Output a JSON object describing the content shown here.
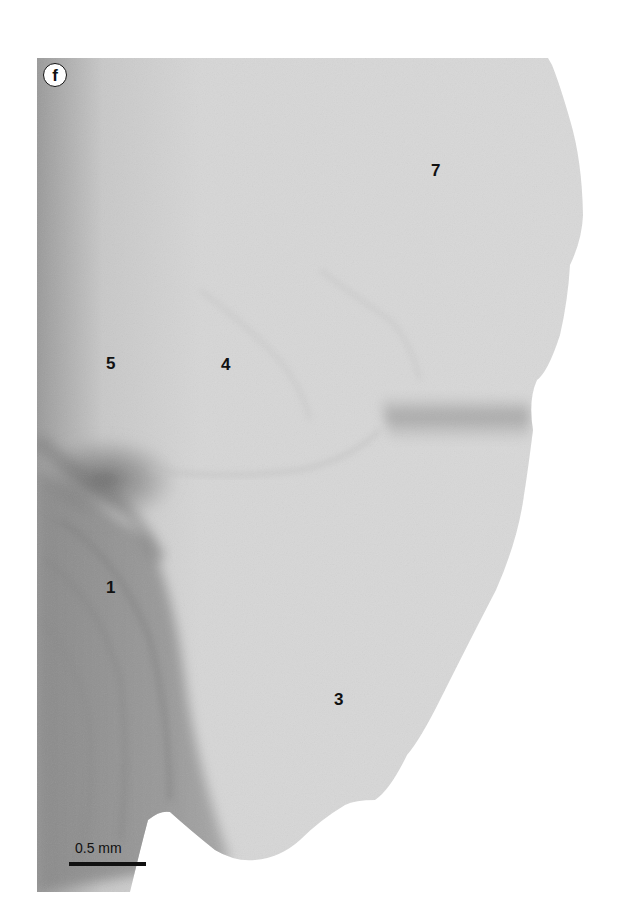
{
  "figure": {
    "panel_label": "f",
    "scale_bar": {
      "label": "0.5 mm"
    },
    "region_labels": [
      {
        "id": "1",
        "text": "1",
        "x": 106,
        "y": 579
      },
      {
        "id": "3",
        "text": "3",
        "x": 334,
        "y": 691
      },
      {
        "id": "4",
        "text": "4",
        "x": 221,
        "y": 356
      },
      {
        "id": "5",
        "text": "5",
        "x": 106,
        "y": 355
      },
      {
        "id": "7",
        "text": "7",
        "x": 431,
        "y": 162
      }
    ],
    "colors": {
      "background": "#ffffff",
      "specimen_light": "#d9d9d9",
      "specimen_mid": "#bdbdbd",
      "specimen_dark": "#6e6e6e",
      "label_text": "#111111"
    }
  }
}
